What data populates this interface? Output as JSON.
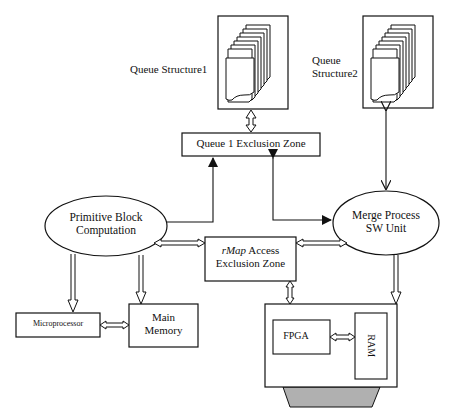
{
  "diagram": {
    "queue_structure_1": {
      "label": "Queue Structure1"
    },
    "queue_structure_2": {
      "label_line1": "Queue",
      "label_line2": "Structure2"
    },
    "queue1_exclusion_zone": {
      "label": "Queue 1 Exclusion Zone"
    },
    "primitive_block": {
      "line1": "Primitive Block",
      "line2": "Computation"
    },
    "merge_process": {
      "line1": "Merge Process",
      "line2": "SW Unit"
    },
    "rmap_zone": {
      "line1_italic": "rMap",
      "line1_rest": " Access",
      "line2": "Exclusion Zone"
    },
    "microprocessor": {
      "label": "Microprocessor"
    },
    "main_memory": {
      "line1": "Main",
      "line2": "Memory"
    },
    "fpga_board": {
      "fpga_label": "FPGA",
      "ram_label": "RAM"
    },
    "colors": {
      "stroke": "#111111",
      "connector_fill": "#b0b0b0",
      "background": "#ffffff"
    }
  }
}
